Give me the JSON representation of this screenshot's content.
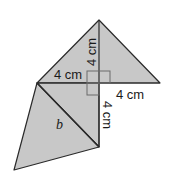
{
  "figure": {
    "type": "geometric-net",
    "fill_color": "#c8c8c8",
    "stroke_color": "#2a2a2a",
    "right_angle_marker_color": "#6a6a6a",
    "labels": {
      "top_vertical": "4 cm",
      "left_horizontal": "4 cm",
      "right_horizontal": "4 cm",
      "bottom_vertical": "4 cm",
      "hypotenuse": "b"
    }
  }
}
